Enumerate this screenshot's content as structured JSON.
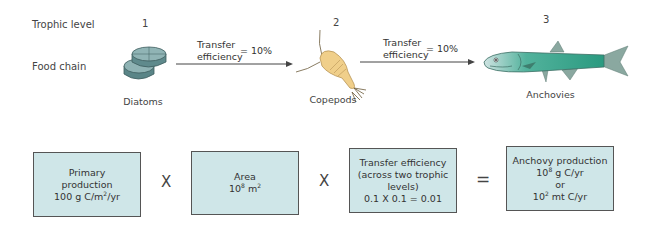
{
  "rows": {
    "trophic_level_label": "Trophic level",
    "food_chain_label": "Food chain"
  },
  "levels": [
    {
      "number": "1",
      "organism": "Diatoms",
      "icon": "diatoms-icon"
    },
    {
      "number": "2",
      "organism": "Copepods",
      "icon": "copepod-icon"
    },
    {
      "number": "3",
      "organism": "Anchovies",
      "icon": "anchovy-icon"
    }
  ],
  "arrows": [
    {
      "line1": "Transfer",
      "line2": "efficiency",
      "value": "= 10%"
    },
    {
      "line1": "Transfer",
      "line2": "efficiency",
      "value": "= 10%"
    }
  ],
  "equation": {
    "boxes": [
      {
        "lines": [
          "Primary",
          "production"
        ],
        "value_base": "100 g C/m",
        "value_sup": "2",
        "value_tail": "/yr"
      },
      {
        "lines": [
          "Area"
        ],
        "value_base": "10",
        "value_sup": "8",
        "value_tail": " m",
        "value_sup2": "2"
      },
      {
        "lines": [
          "Transfer efficiency",
          "(across two trophic",
          "levels)",
          "0.1 X 0.1 = 0.01"
        ]
      },
      {
        "title": "Anchovy production",
        "v1_base": "10",
        "v1_sup": "8",
        "v1_tail": " g C/yr",
        "or": "or",
        "v2_base": "10",
        "v2_sup": "2",
        "v2_tail": " mt C/yr"
      }
    ],
    "operators": [
      "X",
      "X",
      "="
    ]
  },
  "colors": {
    "box_fill": "#cfe6e8",
    "diatom": "#5f8a8c",
    "copepod": "#f0cf8a",
    "anchovy": "#2fa48a"
  }
}
